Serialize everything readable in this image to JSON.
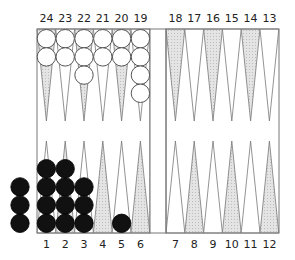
{
  "colors": {
    "frame": "#777777",
    "point_light": "#ffffff",
    "point_shaded": "#dcdcdc",
    "white_checker": "#ffffff",
    "black_checker": "#111111",
    "label": "#222222"
  },
  "top_labels": [
    "24",
    "23",
    "22",
    "21",
    "20",
    "19",
    "18",
    "17",
    "16",
    "15",
    "14",
    "13"
  ],
  "bottom_labels": [
    "1",
    "2",
    "3",
    "4",
    "5",
    "6",
    "7",
    "8",
    "9",
    "10",
    "11",
    "12"
  ],
  "white_checkers": {
    "24": 2,
    "23": 2,
    "22": 3,
    "21": 2,
    "20": 2,
    "19": 4
  },
  "black_checkers": {
    "1": 4,
    "2": 4,
    "3": 3,
    "5": 1
  },
  "black_borne_off": 3,
  "white_borne_off": 0
}
